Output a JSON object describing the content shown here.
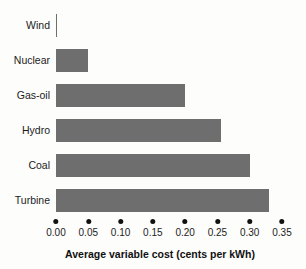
{
  "chart_data": {
    "type": "bar",
    "orientation": "horizontal",
    "title": "",
    "xlabel": "Average variable cost (cents per kWh)",
    "ylabel": "",
    "categories": [
      "Wind",
      "Nuclear",
      "Gas-oil",
      "Hydro",
      "Coal",
      "Turbine"
    ],
    "values": [
      0.002,
      0.05,
      0.2,
      0.255,
      0.3,
      0.33
    ],
    "xlim": [
      0.0,
      0.35
    ],
    "xticks": [
      0.0,
      0.05,
      0.1,
      0.15,
      0.2,
      0.25,
      0.3,
      0.35
    ],
    "xtick_labels": [
      "0.00",
      "0.05",
      "0.10",
      "0.15",
      "0.20",
      "0.25",
      "0.30",
      "0.35"
    ],
    "grid": false,
    "legend": null,
    "series": [
      {
        "name": "Average variable cost",
        "values": [
          0.002,
          0.05,
          0.2,
          0.255,
          0.3,
          0.33
        ]
      }
    ]
  },
  "style": {
    "bar_color": "#6e6e6e",
    "background": "#fdfdfb",
    "text_color": "#1c1c1c",
    "tick_marker": "dot"
  }
}
